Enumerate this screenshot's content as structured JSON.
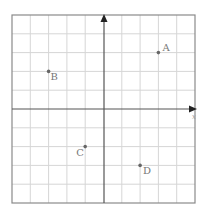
{
  "diagram": {
    "type": "coordinate-plane",
    "grid": {
      "xmin": -5,
      "xmax": 5,
      "ymin": -5,
      "ymax": 5,
      "step": 1
    },
    "axes": {
      "x_label": "x",
      "y_label": ""
    },
    "colors": {
      "grid": "#d6d6d6",
      "border": "#8a8a8a",
      "axis": "#555555",
      "point": "#666666",
      "label": "#777777"
    },
    "points": [
      {
        "label": "A",
        "x": 3,
        "y": 3
      },
      {
        "label": "B",
        "x": -3,
        "y": 2
      },
      {
        "label": "C",
        "x": -1,
        "y": -2
      },
      {
        "label": "D",
        "x": 2,
        "y": -3
      }
    ]
  }
}
